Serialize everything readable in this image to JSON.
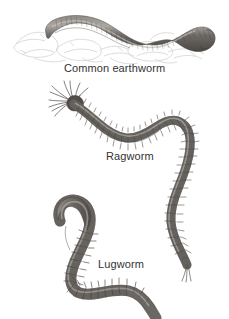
{
  "figure": {
    "background_color": "#ffffff",
    "body_color": "#6e6a66",
    "body_dark": "#4a4744",
    "body_light": "#9d9894",
    "soil_color": "#cfcbc6",
    "label_color": "#333333"
  },
  "labels": {
    "earthworm": "Common earthworm",
    "ragworm": "Ragworm",
    "lugworm": "Lugworm"
  },
  "specimens": [
    {
      "name": "earthworm",
      "label": "Common earthworm",
      "description": "Thick smooth segmented worm lying on sketched soil clods, head at left tapering, body arching in a shallow S across the top, thick blunt tail curling at right",
      "features": [
        "smooth-cuticle",
        "fine-annulation",
        "no-bristles-visible",
        "soil-substrate-sketch"
      ]
    },
    {
      "name": "ragworm",
      "label": "Ragworm",
      "description": "Slender segmented polychaete with fan of head tentacles and palps at upper left, body sweeping in a long S-curve to the right and down, ending in fine tail cerci",
      "features": [
        "head-tentacles",
        "parapodia-bristles",
        "distinct-segments",
        "tail-cerci"
      ]
    },
    {
      "name": "lugworm",
      "label": "Lugworm",
      "description": "Stout worm with smooth swollen head curving at upper left, bristly mid-body segments descending, then a smooth tapering tail sweeping right and down",
      "features": [
        "swollen-smooth-head",
        "bristly-mid-segments",
        "smooth-tapering-tail"
      ]
    }
  ]
}
